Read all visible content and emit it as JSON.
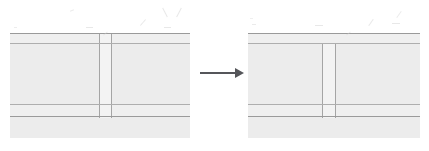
{
  "document": {
    "kind": "scanned-technical-diagram",
    "title": "Cross-section transformation diagram",
    "description": "Two grayscale scanned cross-section elevations of a layered wall or slab assembly, joined left-to-right by a solid arrow indicating a change of state.",
    "background_color": "#ffffff",
    "ink_color": "#9a9a9a",
    "fill_color": "#ececec",
    "arrow_color": "#55565a"
  },
  "canvas": {
    "width": 429,
    "height": 151
  },
  "figures": [
    {
      "id": "before",
      "role": "left-figure",
      "label": "",
      "frame": {
        "x": 10,
        "y": 31,
        "width": 180,
        "height": 107
      },
      "horizontal_rules": [
        {
          "name": "top-rule",
          "y": 33,
          "x": 10,
          "width": 180,
          "weight": 1
        },
        {
          "name": "upper-band-top",
          "y": 43,
          "x": 10,
          "width": 180,
          "weight": 1
        },
        {
          "name": "lower-band-top",
          "y": 104,
          "x": 10,
          "width": 180,
          "weight": 1
        },
        {
          "name": "base-rule",
          "y": 116,
          "x": 10,
          "width": 180,
          "weight": 1
        }
      ],
      "bands": [
        {
          "name": "upper-thin-band",
          "y": 34,
          "height": 9,
          "fill": "#efefef"
        },
        {
          "name": "main-band",
          "y": 44,
          "height": 60,
          "fill": "#ececec"
        },
        {
          "name": "lower-thin-band",
          "y": 105,
          "height": 11,
          "fill": "#efefef"
        },
        {
          "name": "base-band",
          "y": 117,
          "height": 21,
          "fill": "#ececec"
        }
      ],
      "column": {
        "name": "vertical-member",
        "x": 99,
        "width": 12,
        "top": 33,
        "bottom": 117,
        "fill": "#f3f3f3",
        "note": "full-height vertical member spanning from top rule down to base rule"
      }
    },
    {
      "id": "after",
      "role": "right-figure",
      "label": "",
      "frame": {
        "x": 248,
        "y": 31,
        "width": 172,
        "height": 107
      },
      "horizontal_rules": [
        {
          "name": "top-rule",
          "y": 33,
          "x": 248,
          "width": 172,
          "weight": 1
        },
        {
          "name": "upper-band-top",
          "y": 43,
          "x": 248,
          "width": 172,
          "weight": 1
        },
        {
          "name": "lower-band-top",
          "y": 104,
          "x": 248,
          "width": 172,
          "weight": 1
        },
        {
          "name": "base-rule",
          "y": 116,
          "x": 248,
          "width": 172,
          "weight": 1
        }
      ],
      "bands": [
        {
          "name": "upper-thin-band",
          "y": 34,
          "height": 9,
          "fill": "#efefef"
        },
        {
          "name": "main-band",
          "y": 44,
          "height": 60,
          "fill": "#ececec"
        },
        {
          "name": "lower-thin-band",
          "y": 105,
          "height": 11,
          "fill": "#efefef"
        },
        {
          "name": "base-band",
          "y": 117,
          "height": 21,
          "fill": "#ececec"
        }
      ],
      "column": {
        "name": "vertical-member",
        "x": 322,
        "width": 13,
        "top": 43,
        "bottom": 117,
        "fill": "#f3f3f3",
        "note": "vertical member starts below the upper band, stopping short of the top rule"
      }
    }
  ],
  "arrow": {
    "name": "transformation-arrow",
    "direction": "right",
    "x": 200,
    "y": 73,
    "shaft_length": 36,
    "head_width": 9,
    "color": "#55565a"
  },
  "stray_marks": [
    {
      "x": 70,
      "y": 10,
      "width": 4,
      "height": 1,
      "angle": -20,
      "opacity": 0.45
    },
    {
      "x": 86,
      "y": 27,
      "width": 7,
      "height": 1,
      "angle": 0,
      "opacity": 0.5
    },
    {
      "x": 139,
      "y": 22,
      "width": 8,
      "height": 1,
      "angle": -48,
      "opacity": 0.5
    },
    {
      "x": 160,
      "y": 12,
      "width": 10,
      "height": 1,
      "angle": 62,
      "opacity": 0.5
    },
    {
      "x": 174,
      "y": 12,
      "width": 10,
      "height": 1,
      "angle": -62,
      "opacity": 0.5
    },
    {
      "x": 164,
      "y": 27,
      "width": 7,
      "height": 1,
      "angle": 0,
      "opacity": 0.5
    },
    {
      "x": 14,
      "y": 27,
      "width": 3,
      "height": 1,
      "angle": 0,
      "opacity": 0.4
    },
    {
      "x": 252,
      "y": 24,
      "width": 4,
      "height": 1,
      "angle": 0,
      "opacity": 0.45
    },
    {
      "x": 250,
      "y": 18,
      "width": 3,
      "height": 1,
      "angle": 0,
      "opacity": 0.35
    },
    {
      "x": 315,
      "y": 25,
      "width": 8,
      "height": 1,
      "angle": 0,
      "opacity": 0.5
    },
    {
      "x": 367,
      "y": 22,
      "width": 8,
      "height": 1,
      "angle": -55,
      "opacity": 0.5
    },
    {
      "x": 392,
      "y": 23,
      "width": 8,
      "height": 1,
      "angle": 0,
      "opacity": 0.5
    },
    {
      "x": 395,
      "y": 14,
      "width": 8,
      "height": 1,
      "angle": -55,
      "opacity": 0.45
    },
    {
      "x": 346,
      "y": 33,
      "width": 5,
      "height": 1,
      "angle": -38,
      "opacity": 0.4
    },
    {
      "x": 103,
      "y": 33,
      "width": 5,
      "height": 1,
      "angle": -38,
      "opacity": 0.4
    }
  ]
}
